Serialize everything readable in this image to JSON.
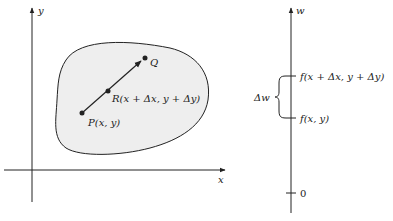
{
  "left_panel": {
    "axis_labels": {
      "x": "x",
      "y": "y"
    },
    "region_fill": "#eeeeee",
    "points": {
      "P": {
        "label": "P(x, y)"
      },
      "R": {
        "label": "R(x + Δx, y + Δy)"
      },
      "Q": {
        "label": "Q"
      }
    }
  },
  "right_panel": {
    "axis_label": "w",
    "ticks": [
      {
        "label": "f(x + Δx, y + Δy)"
      },
      {
        "label": "f(x, y)"
      },
      {
        "label": "0"
      }
    ],
    "brace_label": "Δw"
  }
}
